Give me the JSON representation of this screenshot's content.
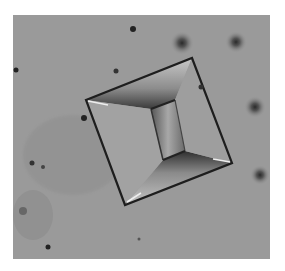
{
  "image": {
    "subject": "crystal-micrograph",
    "background_color": "#9a9a9a",
    "frame_color": "#ffffff"
  }
}
